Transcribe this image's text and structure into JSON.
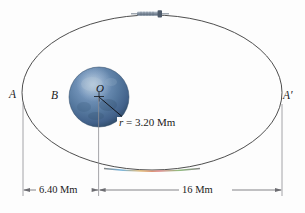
{
  "figure": {
    "labels": {
      "apogee_left": "A",
      "apogee_right": "A′",
      "planet": "B",
      "center": "O"
    },
    "annotations": {
      "radius_symbol": "r",
      "radius_equals": " = ",
      "radius_value": "3.20 Mm",
      "radius_full": "r = 3.20 Mm",
      "dim_left_value": "6.40 Mm",
      "dim_right_value": "16 Mm"
    },
    "objects": {
      "spacecraft_name": "spacecraft-icon",
      "planet_name": "planet-sphere"
    },
    "colors": {
      "planet_dark": "#3e5f84",
      "planet_mid": "#5b7ea6",
      "planet_light": "#9fb8d0",
      "orbit_stroke": "#3a3a3a",
      "dimension_stroke": "#8d8d92",
      "text": "#1b1b1b",
      "background": "#fdfdfd"
    },
    "chart_data": {
      "type": "diagram",
      "orbit": {
        "shape": "ellipse",
        "center_px": [
          152,
          92
        ],
        "rx_px": 130,
        "ry_px": 77
      },
      "planet": {
        "center_px": [
          99,
          97
        ],
        "radius_px": 30,
        "radius_label": "3.20 Mm"
      },
      "dimensions": [
        {
          "label": "6.40 Mm",
          "from_px": 23,
          "to_px": 98,
          "y_px": 190
        },
        {
          "label": "16 Mm",
          "from_px": 98,
          "to_px": 282,
          "y_px": 190
        }
      ]
    }
  }
}
